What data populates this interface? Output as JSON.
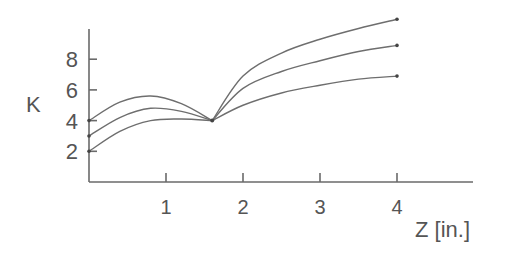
{
  "chart_data": {
    "type": "line",
    "title": "",
    "xlabel": "Z [in.]",
    "ylabel": "K",
    "xlim": [
      0,
      5
    ],
    "ylim": [
      0,
      10.5
    ],
    "x_ticks": [
      "1",
      "2",
      "3",
      "4"
    ],
    "y_ticks": [
      "2",
      "4",
      "6",
      "8"
    ],
    "grid": false,
    "legend": null,
    "series": [
      {
        "name": "upper",
        "x": [
          0,
          0.4,
          0.8,
          1.2,
          1.6,
          2.0,
          2.5,
          3.0,
          3.5,
          4.0
        ],
        "values": [
          4.0,
          5.2,
          5.6,
          5.1,
          4.0,
          6.9,
          8.4,
          9.3,
          10.0,
          10.6
        ]
      },
      {
        "name": "middle",
        "x": [
          0,
          0.4,
          0.8,
          1.2,
          1.6,
          2.0,
          2.5,
          3.0,
          3.5,
          4.0
        ],
        "values": [
          3.0,
          4.2,
          4.8,
          4.6,
          4.0,
          6.1,
          7.2,
          7.9,
          8.5,
          8.9
        ]
      },
      {
        "name": "lower",
        "x": [
          0,
          0.4,
          0.8,
          1.2,
          1.6,
          2.0,
          2.5,
          3.0,
          3.5,
          4.0
        ],
        "values": [
          2.0,
          3.3,
          4.0,
          4.1,
          4.0,
          5.0,
          5.8,
          6.3,
          6.7,
          6.9
        ]
      }
    ]
  },
  "labels": {
    "y_axis": "K",
    "x_axis": "Z [in.]",
    "x_ticks": [
      "1",
      "2",
      "3",
      "4"
    ],
    "y_ticks": [
      "2",
      "4",
      "6",
      "8"
    ]
  }
}
